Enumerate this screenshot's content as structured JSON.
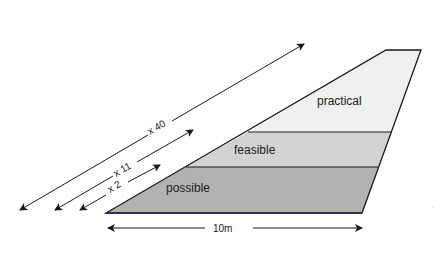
{
  "diagram": {
    "layers": [
      {
        "id": "possible",
        "label": "possible",
        "color": "#b2b2b2"
      },
      {
        "id": "feasible",
        "label": "feasible",
        "color": "#d2d2d2"
      },
      {
        "id": "practical",
        "label": "practical",
        "color": "#efefef"
      }
    ],
    "width_label": "10m",
    "multipliers": [
      {
        "label": "x 2"
      },
      {
        "label": "x 11"
      },
      {
        "label": "x 40"
      }
    ]
  }
}
